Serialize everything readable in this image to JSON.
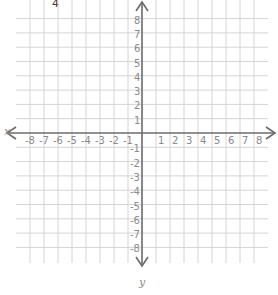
{
  "header": {
    "number": "4"
  },
  "graph": {
    "x_axis_label": "x",
    "y_axis_label": "y",
    "x_ticks": [
      "-8",
      "-7",
      "-6",
      "-5",
      "-4",
      "-3",
      "-2",
      "-1",
      "1",
      "2",
      "3",
      "4",
      "5",
      "6",
      "7",
      "8"
    ],
    "y_ticks": [
      "8",
      "7",
      "6",
      "5",
      "4",
      "3",
      "2",
      "1",
      "-1",
      "-2",
      "-3",
      "-4",
      "-5",
      "-6",
      "-7",
      "-8"
    ],
    "range": {
      "xmin": -8,
      "xmax": 8,
      "ymin": -8,
      "ymax": 8
    },
    "colors": {
      "grid": "#d4d4d4",
      "axis": "#6b6b6b",
      "label": "#8a8a8a"
    }
  }
}
